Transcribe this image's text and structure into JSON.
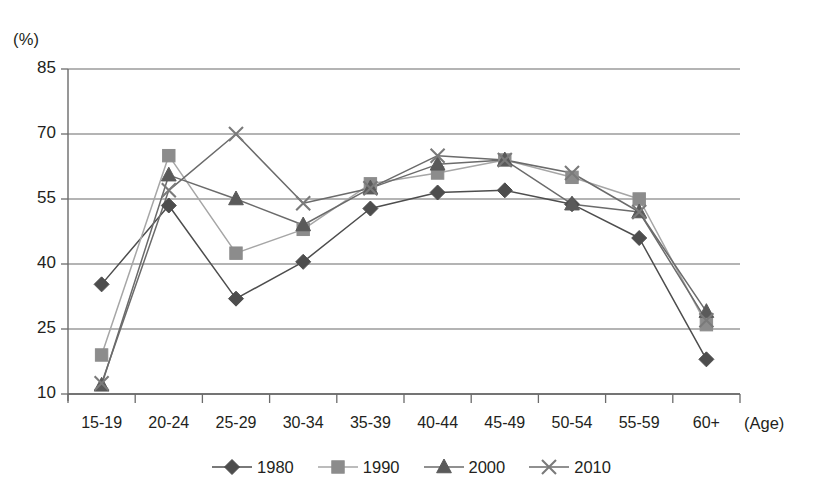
{
  "chart_data": {
    "type": "line",
    "title": "",
    "subtitle": "",
    "xlabel": "(Age)",
    "ylabel": "(%)",
    "ylim": [
      10,
      85
    ],
    "yticks": [
      10,
      25,
      40,
      55,
      70,
      85
    ],
    "grid": true,
    "legend_position": "bottom-center",
    "categories": [
      "15-19",
      "20-24",
      "25-29",
      "30-34",
      "35-39",
      "40-44",
      "45-49",
      "50-54",
      "55-59",
      "60+"
    ],
    "series": [
      {
        "name": "1980",
        "marker": "diamond",
        "color": "#4d4d4d",
        "line_color": "#4d4d4d",
        "values": [
          35.3,
          53.5,
          32.0,
          40.5,
          52.8,
          56.5,
          57.0,
          53.8,
          46.0,
          18.0
        ]
      },
      {
        "name": "1990",
        "marker": "square",
        "color": "#8c8c8c",
        "line_color": "#a6a6a6",
        "values": [
          19.0,
          65.0,
          42.5,
          48.0,
          58.5,
          61.0,
          64.0,
          60.0,
          55.0,
          26.0
        ]
      },
      {
        "name": "2000",
        "marker": "triangle",
        "color": "#5a5a5a",
        "line_color": "#6b6b6b",
        "values": [
          12.0,
          60.5,
          55.0,
          49.0,
          57.5,
          63.0,
          64.0,
          53.8,
          52.0,
          29.0
        ]
      },
      {
        "name": "2010",
        "marker": "cross",
        "color": "#7a7a7a",
        "line_color": "#6b6b6b",
        "values": [
          12.5,
          57.0,
          70.0,
          54.0,
          57.5,
          65.0,
          64.0,
          61.0,
          52.0,
          27.0
        ]
      }
    ]
  },
  "axis": {
    "y_unit": "(%)",
    "x_unit": "(Age)",
    "ytick_labels": [
      "85",
      "70",
      "55",
      "40",
      "25",
      "10"
    ],
    "xtick_labels": [
      "15-19",
      "20-24",
      "25-29",
      "30-34",
      "35-39",
      "40-44",
      "45-49",
      "50-54",
      "55-59",
      "60+"
    ]
  },
  "legend": {
    "items": [
      {
        "label": "1980",
        "marker": "diamond-marker"
      },
      {
        "label": "1990",
        "marker": "square-marker"
      },
      {
        "label": "2000",
        "marker": "triangle-marker"
      },
      {
        "label": "2010",
        "marker": "cross-marker"
      }
    ]
  },
  "colors": {
    "series_1980": "#4d4d4d",
    "series_1990": "#8c8c8c",
    "series_2000": "#5a5a5a",
    "series_2010": "#7a7a7a",
    "grid": "#6b6b6b",
    "axis": "#6b6b6b",
    "text": "#231f20",
    "background": "#ffffff"
  }
}
